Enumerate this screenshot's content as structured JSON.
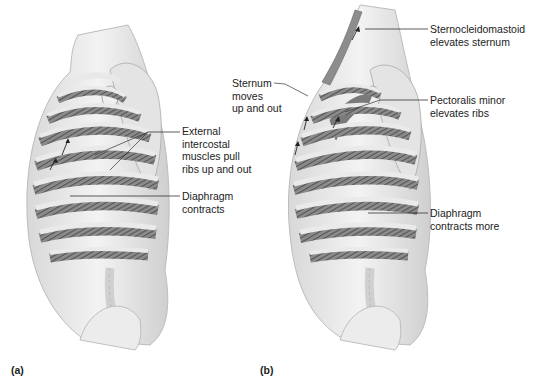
{
  "figure": {
    "panels": [
      {
        "id": "a",
        "panel_label": "(a)",
        "annotations": [
          {
            "text": "External\nintercostal\nmuscles pull\nribs up and out"
          },
          {
            "text": "Diaphragm\ncontracts"
          }
        ]
      },
      {
        "id": "b",
        "panel_label": "(b)",
        "annotations": [
          {
            "text": "Sternocleidomastoid\nelevates sternum"
          },
          {
            "text": "Sternum\nmoves\nup and out"
          },
          {
            "text": "Pectoralis minor\nelevates ribs"
          },
          {
            "text": "Diaphragm\ncontracts more"
          }
        ]
      }
    ],
    "colors": {
      "background": "#ffffff",
      "bone": "#e9e9e9",
      "shade": "#9a9a9a",
      "muscle": "#6f6f6f",
      "line": "#333333"
    }
  }
}
